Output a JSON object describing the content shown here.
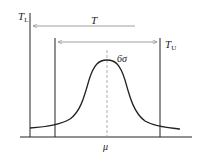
{
  "diagram": {
    "type": "process-capability-normal-distribution",
    "labels": {
      "lower_tolerance": "T",
      "lower_tolerance_sub": "L",
      "upper_tolerance": "T",
      "upper_tolerance_sub": "U",
      "tolerance_range": "T",
      "spread": "6σ",
      "mean": "μ"
    },
    "colors": {
      "line": "#222222",
      "arrow": "#888888",
      "dashed": "#999999"
    }
  }
}
